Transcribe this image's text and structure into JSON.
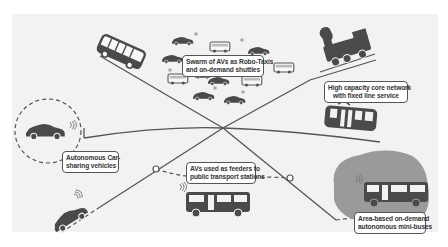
{
  "diagram": {
    "colors": {
      "background": "#ffffff",
      "panel": "#f2f2f2",
      "lines": "#555555",
      "vehicles": "#4a4a4a",
      "service_area": "#9a9a9a",
      "label_border": "#555555",
      "label_text": "#333333"
    },
    "labels": {
      "swarm": {
        "line1": "Swarm of AVs as Robo-Taxis",
        "line2": "and on-demand shuttles"
      },
      "core_network": {
        "line1": "High capacity core network",
        "line2": "with fixed line service"
      },
      "car_sharing": {
        "line1": "Autonomous Car-",
        "line2": "sharing vehicles"
      },
      "feeders": {
        "line1": "AVs used as feeders to",
        "line2": "public transport stations"
      },
      "mini_buses": {
        "line1": "Area-based on-demand",
        "line2": "autonomous mini-buses"
      }
    },
    "nodes": [
      {
        "id": "central-hub",
        "x": 223,
        "y": 128
      },
      {
        "id": "feeder-station-left",
        "x": 156,
        "y": 169
      },
      {
        "id": "feeder-station-right",
        "x": 290,
        "y": 178
      }
    ],
    "vehicles": [
      {
        "type": "bus",
        "role": "swarm shuttle"
      },
      {
        "type": "steam-train",
        "role": "core network"
      },
      {
        "type": "tram",
        "role": "core network"
      },
      {
        "type": "car",
        "role": "car-sharing"
      },
      {
        "type": "car",
        "role": "autonomous car"
      },
      {
        "type": "minibus",
        "role": "feeder"
      },
      {
        "type": "minibus",
        "role": "area-based on-demand"
      }
    ]
  }
}
